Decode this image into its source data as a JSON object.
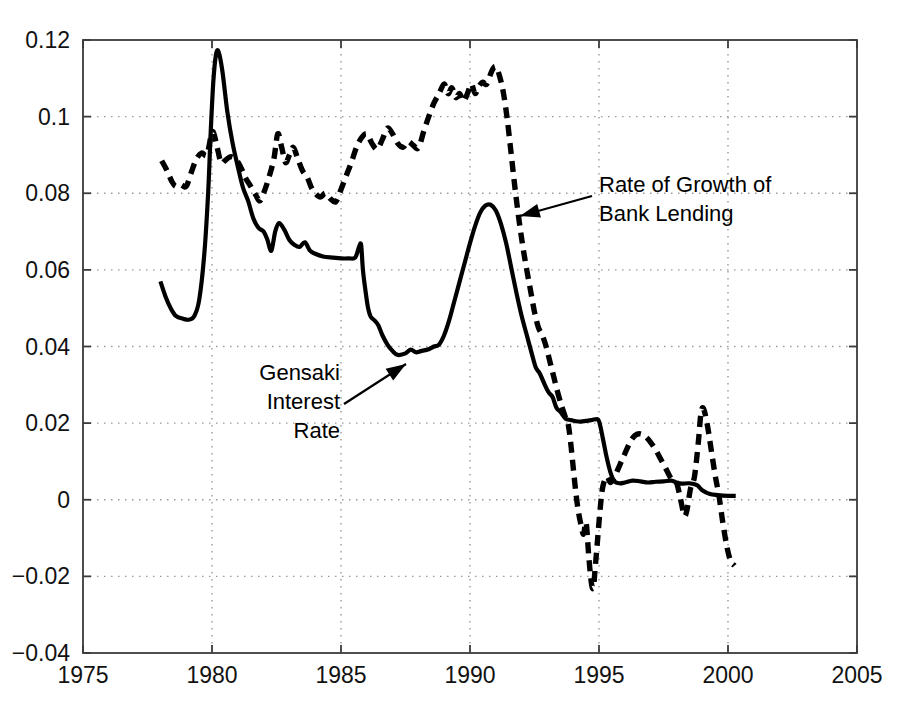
{
  "figure": {
    "background_color": "#ffffff",
    "line_color": "#000000",
    "grid_color": "#9a9a9a",
    "axis_color": "#3b3b3b"
  },
  "axes": {
    "x_ticks": [
      "1975",
      "1980",
      "1985",
      "1990",
      "1995",
      "2000",
      "2005"
    ],
    "y_ticks": [
      "0.12",
      "0.1",
      "0.08",
      "0.06",
      "0.04",
      "0.02",
      "0",
      "-0.02",
      "-0.04"
    ]
  },
  "annotations": {
    "lending": {
      "line1": "Rate of Growth of",
      "line2": "Bank Lending"
    },
    "gensaki": {
      "line1": "Gensaki",
      "line2": "Interest",
      "line3": "Rate"
    }
  },
  "chart_data": {
    "type": "line",
    "title": "",
    "xlabel": "",
    "ylabel": "",
    "xlim": [
      1975,
      2005
    ],
    "ylim": [
      -0.04,
      0.12
    ],
    "x_ticks": [
      1975,
      1980,
      1985,
      1990,
      1995,
      2000,
      2005
    ],
    "y_ticks": [
      -0.04,
      -0.02,
      0,
      0.02,
      0.04,
      0.06,
      0.08,
      0.1,
      0.12
    ],
    "grid": true,
    "grid_style": "dotted",
    "legend": "annotations-with-arrows",
    "series": [
      {
        "name": "Gensaki Interest Rate",
        "style": "solid",
        "color": "#000000",
        "points": [
          [
            1978.0,
            0.057
          ],
          [
            1978.2,
            0.053
          ],
          [
            1978.4,
            0.05
          ],
          [
            1978.6,
            0.048
          ],
          [
            1978.9,
            0.0472
          ],
          [
            1979.1,
            0.047
          ],
          [
            1979.3,
            0.0478
          ],
          [
            1979.5,
            0.052
          ],
          [
            1979.7,
            0.064
          ],
          [
            1979.85,
            0.08
          ],
          [
            1979.95,
            0.096
          ],
          [
            1980.05,
            0.109
          ],
          [
            1980.15,
            0.116
          ],
          [
            1980.25,
            0.117
          ],
          [
            1980.4,
            0.112
          ],
          [
            1980.6,
            0.101
          ],
          [
            1980.8,
            0.093
          ],
          [
            1981.0,
            0.087
          ],
          [
            1981.2,
            0.0815
          ],
          [
            1981.4,
            0.078
          ],
          [
            1981.6,
            0.0735
          ],
          [
            1981.8,
            0.071
          ],
          [
            1982.0,
            0.07
          ],
          [
            1982.15,
            0.0678
          ],
          [
            1982.3,
            0.065
          ],
          [
            1982.45,
            0.07
          ],
          [
            1982.6,
            0.0722
          ],
          [
            1982.8,
            0.0705
          ],
          [
            1983.0,
            0.0678
          ],
          [
            1983.2,
            0.0665
          ],
          [
            1983.4,
            0.066
          ],
          [
            1983.6,
            0.0672
          ],
          [
            1983.8,
            0.065
          ],
          [
            1984.0,
            0.0642
          ],
          [
            1984.3,
            0.0635
          ],
          [
            1984.7,
            0.0632
          ],
          [
            1985.0,
            0.063
          ],
          [
            1985.3,
            0.063
          ],
          [
            1985.55,
            0.0632
          ],
          [
            1985.7,
            0.066
          ],
          [
            1985.78,
            0.0665
          ],
          [
            1985.85,
            0.06
          ],
          [
            1985.95,
            0.0545
          ],
          [
            1986.05,
            0.05
          ],
          [
            1986.15,
            0.0478
          ],
          [
            1986.3,
            0.0468
          ],
          [
            1986.45,
            0.0455
          ],
          [
            1986.6,
            0.043
          ],
          [
            1986.8,
            0.0405
          ],
          [
            1987.0,
            0.0388
          ],
          [
            1987.2,
            0.0378
          ],
          [
            1987.5,
            0.0382
          ],
          [
            1987.7,
            0.0392
          ],
          [
            1987.9,
            0.0385
          ],
          [
            1988.1,
            0.0388
          ],
          [
            1988.4,
            0.0393
          ],
          [
            1988.6,
            0.04
          ],
          [
            1988.8,
            0.0405
          ],
          [
            1989.0,
            0.043
          ],
          [
            1989.2,
            0.047
          ],
          [
            1989.4,
            0.052
          ],
          [
            1989.6,
            0.057
          ],
          [
            1989.8,
            0.062
          ],
          [
            1990.0,
            0.067
          ],
          [
            1990.2,
            0.0715
          ],
          [
            1990.4,
            0.075
          ],
          [
            1990.6,
            0.0768
          ],
          [
            1990.8,
            0.077
          ],
          [
            1991.0,
            0.0755
          ],
          [
            1991.2,
            0.072
          ],
          [
            1991.4,
            0.067
          ],
          [
            1991.6,
            0.0605
          ],
          [
            1991.8,
            0.054
          ],
          [
            1992.0,
            0.048
          ],
          [
            1992.2,
            0.043
          ],
          [
            1992.4,
            0.038
          ],
          [
            1992.55,
            0.0345
          ],
          [
            1992.7,
            0.033
          ],
          [
            1992.9,
            0.03
          ],
          [
            1993.05,
            0.028
          ],
          [
            1993.2,
            0.0268
          ],
          [
            1993.35,
            0.024
          ],
          [
            1993.5,
            0.023
          ],
          [
            1993.7,
            0.0212
          ],
          [
            1993.9,
            0.0208
          ],
          [
            1994.1,
            0.0205
          ],
          [
            1994.3,
            0.0204
          ],
          [
            1994.5,
            0.0206
          ],
          [
            1994.7,
            0.0208
          ],
          [
            1994.85,
            0.021
          ],
          [
            1995.0,
            0.0205
          ],
          [
            1995.15,
            0.016
          ],
          [
            1995.3,
            0.011
          ],
          [
            1995.45,
            0.007
          ],
          [
            1995.6,
            0.0048
          ],
          [
            1995.8,
            0.0043
          ],
          [
            1996.0,
            0.0045
          ],
          [
            1996.3,
            0.005
          ],
          [
            1996.6,
            0.0048
          ],
          [
            1996.9,
            0.0045
          ],
          [
            1997.2,
            0.0047
          ],
          [
            1997.5,
            0.0048
          ],
          [
            1997.8,
            0.005
          ],
          [
            1998.0,
            0.0045
          ],
          [
            1998.2,
            0.0042
          ],
          [
            1998.5,
            0.0043
          ],
          [
            1998.8,
            0.0038
          ],
          [
            1999.0,
            0.0025
          ],
          [
            1999.3,
            0.0015
          ],
          [
            1999.6,
            0.0012
          ],
          [
            2000.0,
            0.001
          ],
          [
            2000.3,
            0.001
          ]
        ]
      },
      {
        "name": "Rate of Growth of Bank Lending",
        "style": "dashed",
        "color": "#000000",
        "points": [
          [
            1978.05,
            0.0885
          ],
          [
            1978.25,
            0.086
          ],
          [
            1978.45,
            0.083
          ],
          [
            1978.6,
            0.0818
          ],
          [
            1978.8,
            0.0822
          ],
          [
            1979.0,
            0.0818
          ],
          [
            1979.2,
            0.0855
          ],
          [
            1979.4,
            0.089
          ],
          [
            1979.6,
            0.0905
          ],
          [
            1979.8,
            0.09
          ],
          [
            1979.95,
            0.0945
          ],
          [
            1980.05,
            0.096
          ],
          [
            1980.2,
            0.092
          ],
          [
            1980.35,
            0.088
          ],
          [
            1980.5,
            0.0885
          ],
          [
            1980.7,
            0.0895
          ],
          [
            1980.9,
            0.089
          ],
          [
            1981.1,
            0.087
          ],
          [
            1981.3,
            0.084
          ],
          [
            1981.5,
            0.0818
          ],
          [
            1981.7,
            0.0795
          ],
          [
            1981.85,
            0.078
          ],
          [
            1982.0,
            0.08
          ],
          [
            1982.2,
            0.084
          ],
          [
            1982.4,
            0.089
          ],
          [
            1982.55,
            0.0955
          ],
          [
            1982.7,
            0.092
          ],
          [
            1982.85,
            0.088
          ],
          [
            1983.0,
            0.09
          ],
          [
            1983.15,
            0.092
          ],
          [
            1983.3,
            0.0895
          ],
          [
            1983.5,
            0.086
          ],
          [
            1983.7,
            0.084
          ],
          [
            1983.85,
            0.0815
          ],
          [
            1984.0,
            0.08
          ],
          [
            1984.2,
            0.079
          ],
          [
            1984.4,
            0.08
          ],
          [
            1984.6,
            0.0785
          ],
          [
            1984.8,
            0.0778
          ],
          [
            1985.0,
            0.081
          ],
          [
            1985.2,
            0.0845
          ],
          [
            1985.4,
            0.088
          ],
          [
            1985.6,
            0.092
          ],
          [
            1985.8,
            0.0945
          ],
          [
            1986.0,
            0.0955
          ],
          [
            1986.2,
            0.093
          ],
          [
            1986.4,
            0.0915
          ],
          [
            1986.6,
            0.094
          ],
          [
            1986.8,
            0.097
          ],
          [
            1987.0,
            0.0955
          ],
          [
            1987.2,
            0.093
          ],
          [
            1987.4,
            0.092
          ],
          [
            1987.6,
            0.0935
          ],
          [
            1987.8,
            0.0925
          ],
          [
            1988.0,
            0.0918
          ],
          [
            1988.2,
            0.096
          ],
          [
            1988.4,
            0.1
          ],
          [
            1988.6,
            0.1035
          ],
          [
            1988.8,
            0.106
          ],
          [
            1989.0,
            0.1085
          ],
          [
            1989.15,
            0.106
          ],
          [
            1989.3,
            0.1075
          ],
          [
            1989.45,
            0.105
          ],
          [
            1989.6,
            0.106
          ],
          [
            1989.75,
            0.104
          ],
          [
            1989.9,
            0.106
          ],
          [
            1990.05,
            0.1085
          ],
          [
            1990.2,
            0.106
          ],
          [
            1990.35,
            0.108
          ],
          [
            1990.5,
            0.109
          ],
          [
            1990.65,
            0.1085
          ],
          [
            1990.85,
            0.112
          ],
          [
            1991.0,
            0.113
          ],
          [
            1991.15,
            0.1105
          ],
          [
            1991.3,
            0.106
          ],
          [
            1991.45,
            0.099
          ],
          [
            1991.6,
            0.09
          ],
          [
            1991.75,
            0.081
          ],
          [
            1991.9,
            0.073
          ],
          [
            1992.05,
            0.066
          ],
          [
            1992.2,
            0.06
          ],
          [
            1992.35,
            0.0545
          ],
          [
            1992.5,
            0.049
          ],
          [
            1992.65,
            0.045
          ],
          [
            1992.8,
            0.043
          ],
          [
            1992.95,
            0.04
          ],
          [
            1993.1,
            0.036
          ],
          [
            1993.25,
            0.032
          ],
          [
            1993.4,
            0.028
          ],
          [
            1993.55,
            0.0245
          ],
          [
            1993.7,
            0.0215
          ],
          [
            1993.8,
            0.02
          ],
          [
            1993.9,
            0.015
          ],
          [
            1994.0,
            0.0085
          ],
          [
            1994.1,
            0.002
          ],
          [
            1994.2,
            -0.003
          ],
          [
            1994.3,
            -0.0065
          ],
          [
            1994.4,
            -0.009
          ],
          [
            1994.5,
            -0.006
          ],
          [
            1994.6,
            -0.0145
          ],
          [
            1994.7,
            -0.0215
          ],
          [
            1994.78,
            -0.023
          ],
          [
            1994.85,
            -0.018
          ],
          [
            1994.95,
            -0.01
          ],
          [
            1995.05,
            -0.002
          ],
          [
            1995.15,
            0.0035
          ],
          [
            1995.3,
            0.006
          ],
          [
            1995.45,
            0.0045
          ],
          [
            1995.6,
            0.006
          ],
          [
            1995.8,
            0.009
          ],
          [
            1996.0,
            0.012
          ],
          [
            1996.2,
            0.015
          ],
          [
            1996.4,
            0.0168
          ],
          [
            1996.6,
            0.0172
          ],
          [
            1996.8,
            0.0165
          ],
          [
            1997.0,
            0.015
          ],
          [
            1997.2,
            0.013
          ],
          [
            1997.4,
            0.0105
          ],
          [
            1997.6,
            0.008
          ],
          [
            1997.8,
            0.0055
          ],
          [
            1998.0,
            0.0045
          ],
          [
            1998.15,
            0.0005
          ],
          [
            1998.3,
            -0.004
          ],
          [
            1998.4,
            -0.003
          ],
          [
            1998.55,
            0.003
          ],
          [
            1998.7,
            0.006
          ],
          [
            1998.85,
            0.015
          ],
          [
            1998.95,
            0.0225
          ],
          [
            1999.05,
            0.0238
          ],
          [
            1999.2,
            0.0195
          ],
          [
            1999.35,
            0.013
          ],
          [
            1999.5,
            0.0065
          ],
          [
            1999.65,
            0.001
          ],
          [
            1999.8,
            -0.006
          ],
          [
            1999.95,
            -0.012
          ],
          [
            2000.1,
            -0.016
          ],
          [
            2000.25,
            -0.0172
          ]
        ]
      }
    ]
  }
}
